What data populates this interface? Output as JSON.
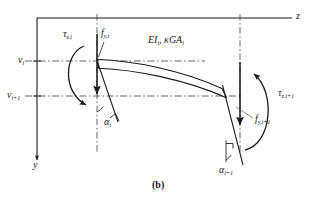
{
  "figure": {
    "caption": "(b)"
  },
  "axes": {
    "horizontal_label": "z",
    "vertical_label": "y"
  },
  "beam": {
    "property_label_prefix": "EI",
    "property_label_sub_1": "i",
    "property_label_mid": ", κGA",
    "property_label_sub_2": "i",
    "property_label_full": "EIᵢ, κGAᵢ"
  },
  "node_i": {
    "moment_symbol": "τ",
    "moment_subscript": "z,i",
    "force_symbol": "f",
    "force_subscript": "y,i",
    "displacement_symbol": "v",
    "displacement_subscript": "i",
    "rotation_symbol": "α",
    "rotation_subscript": "i"
  },
  "node_i_plus_1": {
    "moment_symbol": "τ",
    "moment_subscript": "z,i+1",
    "force_symbol": "f",
    "force_subscript": "y,i+1",
    "displacement_symbol": "v",
    "displacement_subscript": "i+1",
    "rotation_symbol": "α",
    "rotation_subscript": "i+1"
  },
  "colors": {
    "line": "#1a1a1a",
    "dash": "#4a4a4a",
    "background": "#ffffff"
  }
}
